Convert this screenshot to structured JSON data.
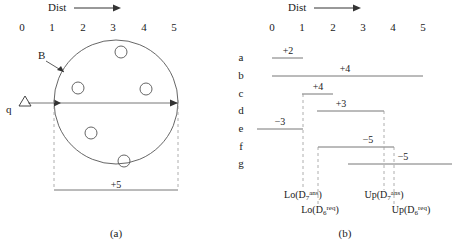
{
  "figure_a": {
    "caption": "(a)",
    "axis": {
      "name": "Dist",
      "arrow": "right-arrow",
      "ticks": [
        "0",
        "1",
        "2",
        "3",
        "4",
        "5"
      ]
    },
    "query_label": "q",
    "query_marker": "triangle",
    "region_label": "B",
    "span_label": "+5",
    "objects_count": 5
  },
  "figure_b": {
    "caption": "(b)",
    "axis": {
      "name": "Dist",
      "arrow": "right-arrow",
      "ticks": [
        "0",
        "1",
        "2",
        "3",
        "4",
        "5"
      ]
    },
    "rows": [
      {
        "id": "a",
        "label": "a",
        "value": "+2",
        "start": 0.0,
        "end": 1.0
      },
      {
        "id": "b",
        "label": "b",
        "value": "+4",
        "start": 0.0,
        "end": 5.0
      },
      {
        "id": "c",
        "label": "c",
        "value": "+4",
        "start": 1.0,
        "end": 2.0
      },
      {
        "id": "d",
        "label": "d",
        "value": "+3",
        "start": 1.5,
        "end": 3.7
      },
      {
        "id": "e",
        "label": "e",
        "value": "−3",
        "start": -0.5,
        "end": 1.0
      },
      {
        "id": "f",
        "label": "f",
        "value": "−5",
        "start": 1.55,
        "end": 4.05
      },
      {
        "id": "g",
        "label": "g",
        "value": "−5",
        "start": 2.55,
        "end": 5.6
      }
    ],
    "bounds": [
      {
        "name": "lo-d7",
        "text": "Lo(D",
        "sub": "7",
        "sup": "ans",
        "close": ")",
        "x": 1.0,
        "row": 1
      },
      {
        "name": "up-d7",
        "text": "Up(D",
        "sub": "7",
        "sup": "ans",
        "close": ")",
        "x": 3.7,
        "row": 1
      },
      {
        "name": "lo-d6",
        "text": "Lo(D",
        "sub": "6",
        "sup": "req",
        "close": ")",
        "x": 1.55,
        "row": 2
      },
      {
        "name": "up-d6",
        "text": "Up(D",
        "sub": "6",
        "sup": "req",
        "close": ")",
        "x": 4.05,
        "row": 2
      }
    ]
  },
  "colors": {
    "ink": "#1a1a1a",
    "line": "#555555",
    "dashed": "#999999"
  }
}
